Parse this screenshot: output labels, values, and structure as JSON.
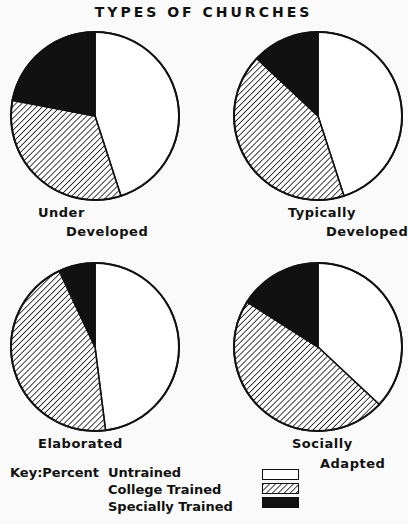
{
  "chart_data": {
    "type": "pie",
    "title": "TYPES OF CHURCHES",
    "legend_title": "Key:Percent",
    "categories": [
      "Untrained",
      "College Trained",
      "Specially Trained"
    ],
    "category_fills": [
      "white",
      "hatched",
      "black"
    ],
    "charts": [
      {
        "name": "Under Developed",
        "label_lines": [
          "Under",
          "Developed"
        ],
        "values": [
          45,
          33,
          22
        ]
      },
      {
        "name": "Typically Developed",
        "label_lines": [
          "Typically",
          "Developed"
        ],
        "values": [
          45,
          42,
          13
        ]
      },
      {
        "name": "Elaborated",
        "label_lines": [
          "Elaborated"
        ],
        "values": [
          48,
          45,
          7
        ]
      },
      {
        "name": "Socially Adapted",
        "label_lines": [
          "Socially",
          "Adapted"
        ],
        "values": [
          37,
          47,
          16
        ]
      }
    ],
    "start_angle": "12 o'clock, clockwise"
  },
  "colors": {
    "background": "#fafafa",
    "ink": "#111111",
    "untrained": "#ffffff",
    "special": "#111111"
  }
}
